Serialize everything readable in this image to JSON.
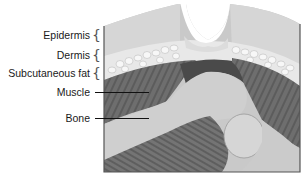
{
  "diagram": {
    "type": "anatomical cross-section",
    "labels": [
      {
        "id": "epidermis",
        "text": "Epidermis",
        "marker": "brace"
      },
      {
        "id": "dermis",
        "text": "Dermis",
        "marker": "brace"
      },
      {
        "id": "subcutaneous_fat",
        "text": "Subcutaneous fat",
        "marker": "brace"
      },
      {
        "id": "muscle",
        "text": "Muscle",
        "marker": "leader-line"
      },
      {
        "id": "bone",
        "text": "Bone",
        "marker": "leader-line"
      }
    ],
    "colors": {
      "epidermis": "#d4d4d4",
      "dermis_fat_cells": "#f2f2f2",
      "muscle": "#6e6e6e",
      "muscle_dark": "#555555",
      "bone": "#c6c6c6",
      "frame": "#555555",
      "text": "#1a1a1a"
    }
  }
}
